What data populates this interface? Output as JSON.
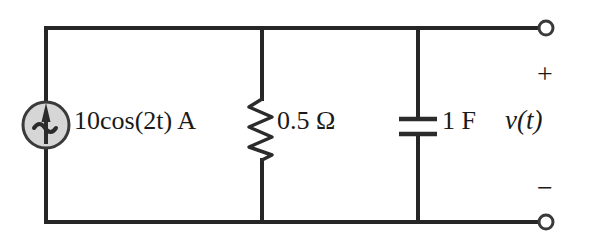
{
  "diagram": {
    "background_color": "#ffffff",
    "wire_color": "#262626"
  },
  "components": {
    "source": {
      "icon": "ac-current-source-icon",
      "label": "10cos(2t) A",
      "amplitude": "10",
      "function": "cos",
      "angular_frequency": "2t",
      "unit": "A",
      "symbol_fill": "#d4d4d4",
      "symbol_stroke": "#3a3a3a"
    },
    "resistor": {
      "icon": "resistor-zigzag-icon",
      "label": "0.5 Ω",
      "value": "0.5",
      "unit": "Ω"
    },
    "capacitor": {
      "icon": "capacitor-plates-icon",
      "label": "1 F",
      "value": "1",
      "unit": "F"
    }
  },
  "terminals": {
    "output_label": "v(t)",
    "plus_sign": "+",
    "minus_sign": "−",
    "top_terminal_name": "top-output-terminal",
    "bottom_terminal_name": "bottom-output-terminal"
  }
}
